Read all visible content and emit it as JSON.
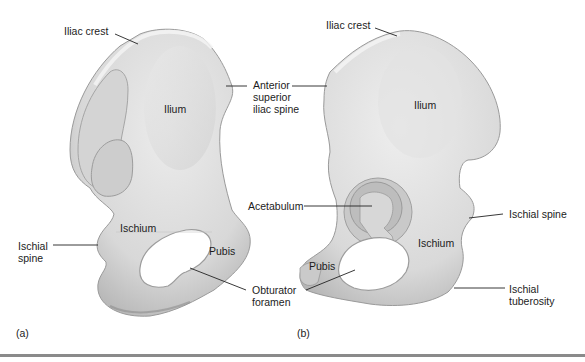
{
  "figure": {
    "panels": [
      {
        "tag": "(a)",
        "view": "lateral view of hip bone",
        "labels": {
          "iliac_crest": "Iliac crest",
          "ilium": "Ilium",
          "ischium": "Ischium",
          "pubis": "Pubis",
          "ischial_spine_1": "Ischial",
          "ischial_spine_2": "spine",
          "obturator_1": "Obturator",
          "obturator_2": "foramen"
        }
      },
      {
        "tag": "(b)",
        "view": "medial view of hip bone",
        "labels": {
          "iliac_crest": "Iliac crest",
          "ilium": "Ilium",
          "acetabulum": "Acetabulum",
          "ischium": "Ischium",
          "pubis": "Pubis",
          "ischial_spine": "Ischial spine",
          "ischial_tuberosity_1": "Ischial",
          "ischial_tuberosity_2": "tuberosity"
        }
      }
    ],
    "shared_labels": {
      "asis_1": "Anterior",
      "asis_2": "superior",
      "asis_3": "iliac spine"
    },
    "colors": {
      "bone_light": "#e6e6e6",
      "bone_mid": "#cfcfcf",
      "bone_shadow": "#a9a9a9",
      "leader_line": "#222222",
      "rule": "#8a8a8a"
    }
  }
}
